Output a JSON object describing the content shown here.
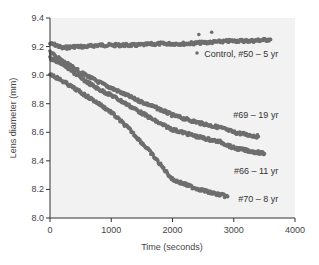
{
  "chart_data": {
    "type": "scatter",
    "title": "",
    "xlabel": "Time (seconds)",
    "ylabel": "Lens diameter (mm)",
    "xlim": [
      0,
      4000
    ],
    "ylim": [
      8.0,
      9.4
    ],
    "xticks": [
      0,
      1000,
      2000,
      3000,
      4000
    ],
    "yticks": [
      8.0,
      8.2,
      8.4,
      8.6,
      8.8,
      9.0,
      9.2,
      9.4
    ],
    "xtick_labels": [
      "0",
      "1000",
      "2000",
      "3000",
      "4000"
    ],
    "ytick_labels": [
      "8.0",
      "8.2",
      "8.4",
      "8.6",
      "8.8",
      "9.0",
      "9.2",
      "9.4"
    ],
    "grid": false,
    "marker_color": "#6e6e6e",
    "plot_background": "#f2f2f2",
    "series": [
      {
        "name": "Control, #50 – 5 yr",
        "label_pos": [
          3500,
          9.15
        ],
        "x": [
          0,
          100,
          200,
          400,
          600,
          800,
          1000,
          1400,
          1800,
          2200,
          2600,
          3000,
          3300,
          3600
        ],
        "y": [
          9.22,
          9.21,
          9.19,
          9.2,
          9.2,
          9.21,
          9.21,
          9.21,
          9.22,
          9.22,
          9.23,
          9.24,
          9.24,
          9.25
        ]
      },
      {
        "name": "#69 – 19 yr",
        "label_pos": [
          3500,
          8.72
        ],
        "x": [
          0,
          200,
          500,
          800,
          1000,
          1400,
          1800,
          2000,
          2400,
          2800,
          3000,
          3400
        ],
        "y": [
          9.16,
          9.1,
          9.02,
          8.95,
          8.91,
          8.83,
          8.76,
          8.72,
          8.67,
          8.63,
          8.6,
          8.57
        ]
      },
      {
        "name": "#66 – 11 yr",
        "label_pos": [
          3500,
          8.33
        ],
        "x": [
          0,
          200,
          500,
          800,
          1000,
          1400,
          1800,
          2000,
          2400,
          2800,
          3000,
          3500
        ],
        "y": [
          9.12,
          9.08,
          8.98,
          8.9,
          8.86,
          8.76,
          8.66,
          8.62,
          8.57,
          8.53,
          8.49,
          8.45
        ]
      },
      {
        "name": "#70 – 8 yr",
        "label_pos": [
          3500,
          8.13
        ],
        "x": [
          0,
          200,
          500,
          800,
          1000,
          1300,
          1600,
          2000,
          2300,
          2600,
          2900
        ],
        "y": [
          9.01,
          8.96,
          8.88,
          8.8,
          8.74,
          8.62,
          8.48,
          8.27,
          8.22,
          8.18,
          8.15
        ]
      }
    ]
  }
}
